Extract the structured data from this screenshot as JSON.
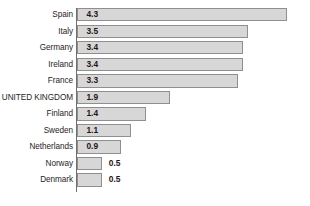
{
  "chart_data": {
    "type": "bar",
    "orientation": "horizontal",
    "title": "",
    "subtitle": "",
    "xlabel": "",
    "ylabel": "",
    "grid": false,
    "legend": null,
    "legend_position": "none",
    "xlim": [
      0,
      4.6
    ],
    "axis": {
      "category_axis": "vertical-left",
      "value_axis_visible": false,
      "tick_labels_visible": false
    },
    "colors": {
      "bar_fill": "#d7d7d7",
      "bar_border": "#8f8f8f",
      "axis_line": "#6f6f6f",
      "label_text": "#282425",
      "value_text": "#1b1718",
      "background": "#ffffff"
    },
    "categories": [
      "Spain",
      "Italy",
      "Germany",
      "Ireland",
      "France",
      "UNITED KINGDOM",
      "Finland",
      "Sweden",
      "Netherlands",
      "Norway",
      "Denmark"
    ],
    "values": [
      4.3,
      3.5,
      3.4,
      3.4,
      3.3,
      1.9,
      1.4,
      1.1,
      0.9,
      0.5,
      0.5
    ],
    "value_labels": [
      "4.3",
      "3.5",
      "3.4",
      "3.4",
      "3.3",
      "1.9",
      "1.4",
      "1.1",
      "0.9",
      "0.5",
      "0.5"
    ],
    "label_placement": [
      "inside",
      "inside",
      "inside",
      "inside",
      "inside",
      "inside",
      "inside",
      "inside",
      "inside",
      "outside",
      "outside"
    ],
    "bars": [
      {
        "category": "Spain",
        "value": 4.3,
        "label": "4.3",
        "placement": "inside"
      },
      {
        "category": "Italy",
        "value": 3.5,
        "label": "3.5",
        "placement": "inside"
      },
      {
        "category": "Germany",
        "value": 3.4,
        "label": "3.4",
        "placement": "inside"
      },
      {
        "category": "Ireland",
        "value": 3.4,
        "label": "3.4",
        "placement": "inside"
      },
      {
        "category": "France",
        "value": 3.3,
        "label": "3.3",
        "placement": "inside"
      },
      {
        "category": "UNITED KINGDOM",
        "value": 1.9,
        "label": "1.9",
        "placement": "inside"
      },
      {
        "category": "Finland",
        "value": 1.4,
        "label": "1.4",
        "placement": "inside"
      },
      {
        "category": "Sweden",
        "value": 1.1,
        "label": "1.1",
        "placement": "inside"
      },
      {
        "category": "Netherlands",
        "value": 0.9,
        "label": "0.9",
        "placement": "inside"
      },
      {
        "category": "Norway",
        "value": 0.5,
        "label": "0.5",
        "placement": "outside"
      },
      {
        "category": "Denmark",
        "value": 0.5,
        "label": "0.5",
        "placement": "outside"
      }
    ]
  }
}
